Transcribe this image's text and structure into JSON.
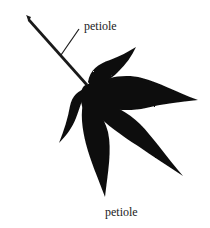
{
  "diagram": {
    "labels": {
      "pointer_label": "petiole",
      "caption": "petiole"
    },
    "colors": {
      "leaf": "#111111",
      "stem": "#1a1a1a",
      "text": "#222222",
      "background": "#ffffff"
    }
  }
}
